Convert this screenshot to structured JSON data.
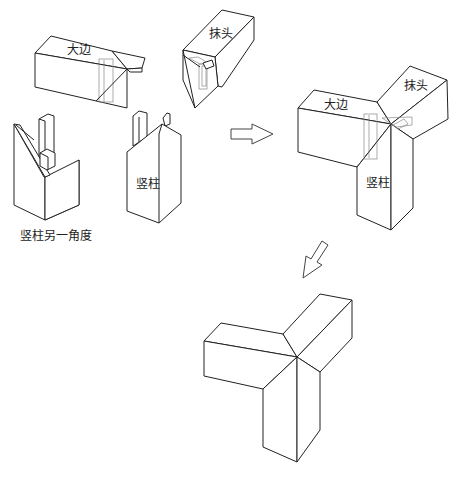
{
  "figure": {
    "type": "joinery-assembly-diagram",
    "line_color": "#222222",
    "background": "#ffffff"
  },
  "labels": {
    "dabian": "大边",
    "motou": "抹头",
    "shuzhu": "竖柱",
    "shuzhu_alt_angle": "竖柱另一角度",
    "assembled_dabian": "大边",
    "assembled_motou": "抹头",
    "assembled_shuzhu": "竖柱"
  },
  "parts": [
    {
      "id": "dabian",
      "label": "大边",
      "role": "long frame member with tenon"
    },
    {
      "id": "motou",
      "label": "抹头",
      "role": "end frame member with mortise"
    },
    {
      "id": "shuzhu",
      "label": "竖柱",
      "role": "vertical post with tenons"
    },
    {
      "id": "shuzhu-alt",
      "label": "竖柱另一角度",
      "role": "vertical post, alternate view"
    }
  ],
  "arrows": [
    {
      "id": "arrow-right",
      "direction": "right",
      "meaning": "assemble"
    },
    {
      "id": "arrow-down-left",
      "direction": "down-left",
      "meaning": "finished joint"
    }
  ],
  "stages": [
    "separate parts",
    "assembled (hidden joints shown)",
    "finished three-way joint"
  ]
}
